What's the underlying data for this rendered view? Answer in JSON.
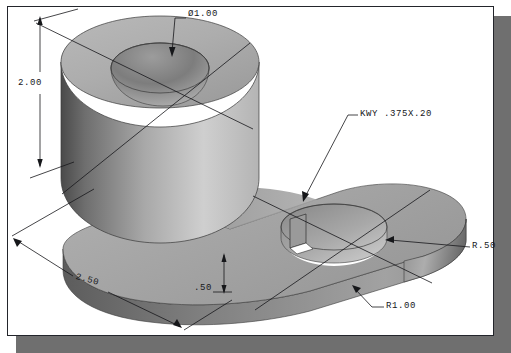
{
  "drawing": {
    "title": "Isometric pictorial of a two-hole bearing bracket",
    "part_description": "Solid-shaded isometric view of a slotted link / bearing bracket with a large boss and a smaller keyed through hole",
    "projection": "isometric",
    "units": "inches",
    "background_color": "#ffffff",
    "frame_color": "#23252b",
    "shadow_color": "#6f6f6f",
    "shading": {
      "highlight": "#d8d8d8",
      "light": "#c2c2c2",
      "mid": "#a6a6a6",
      "dark": "#7e7e7e",
      "darkest": "#4f4f4f",
      "bore_shadow": "#8d8d8d",
      "line_color": "#16171a"
    }
  },
  "annotations": [
    {
      "id": "bore-diameter",
      "name": "diameter-callout",
      "text": "Ø1.00",
      "value": 1.0,
      "symbol": "diameter",
      "feature": "large boss through bore",
      "label_x": 188,
      "label_y": 14,
      "leader": "horizontal shoulder then angled down-left to bore edge"
    },
    {
      "id": "height-2-00",
      "name": "height-dimension",
      "text": "2.00",
      "value": 2.0,
      "feature": "overall boss height",
      "label_x": 22,
      "label_y": 80,
      "leader": "vertical dimension line with arrowheads both ends"
    },
    {
      "id": "length-2-50",
      "name": "length-dimension",
      "text": "2.50",
      "value": 2.5,
      "feature": "overall length along base",
      "label_x": 79,
      "label_y": 277,
      "leader": "angled dimension line with arrowheads both ends"
    },
    {
      "id": "thickness-0-50",
      "name": "thickness-dimension",
      "text": ".50",
      "value": 0.5,
      "feature": "base plate thickness",
      "label_x": 196,
      "label_y": 286,
      "leader": "short vertical dimension line with arrowheads both ends"
    },
    {
      "id": "keyway",
      "name": "keyway-callout",
      "text": "KWY .375X.20",
      "width": 0.375,
      "depth": 0.2,
      "feature": "keyway in small through hole",
      "label_x": 360,
      "label_y": 112,
      "leader": "shoulder then long angled leader down-left to keyway notch"
    },
    {
      "id": "radius-0-50",
      "name": "radius-callout-small",
      "text": "R.50",
      "value": 0.5,
      "feature": "small hole radius",
      "label_x": 473,
      "label_y": 244,
      "leader": "horizontal leader left to hole edge"
    },
    {
      "id": "radius-1-00",
      "name": "radius-callout-large",
      "text": "R1.00",
      "value": 1.0,
      "feature": "rounded end of base plate",
      "label_x": 386,
      "label_y": 304,
      "leader": "horizontal shoulder then angled up-left to rounded edge"
    }
  ],
  "centerlines": [
    {
      "name": "large-boss-centerline-a",
      "feature": "large boss"
    },
    {
      "name": "large-boss-centerline-b",
      "feature": "large boss"
    },
    {
      "name": "small-hole-centerline-a",
      "feature": "small hole"
    },
    {
      "name": "small-hole-centerline-b",
      "feature": "small hole"
    }
  ]
}
